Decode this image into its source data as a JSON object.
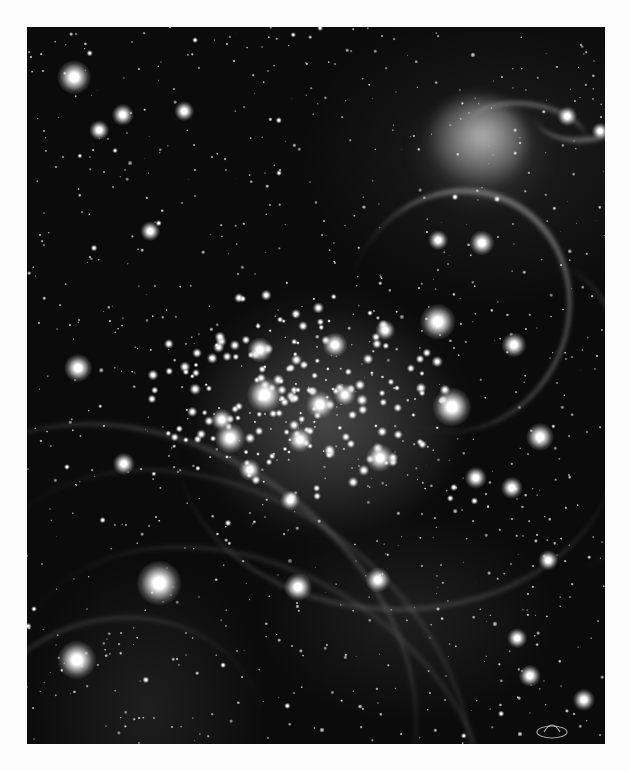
{
  "page": {
    "background": "#fcfcfc",
    "caption_top": "",
    "caption_bottom": ""
  },
  "image": {
    "description": "Grayscale astronomical photograph of a dense young star cluster with surrounding nebula filaments",
    "colors": {
      "sky": "#0b0b0b",
      "star_core": "#ffffff",
      "nebula": "#9a9a9a"
    },
    "bounds": {
      "left": 27,
      "top": 27,
      "width": 578,
      "height": 717
    },
    "cluster_center": {
      "x": 300,
      "y": 390
    },
    "nebula_features": [
      {
        "name": "swirl-nebula-top-right",
        "x": 445,
        "y": 120,
        "w": 90,
        "h": 80
      },
      {
        "name": "arc-filament-center-right",
        "from": [
          360,
          200
        ],
        "to": [
          470,
          300
        ]
      },
      {
        "name": "arc-filament-top-right",
        "from": [
          530,
          70
        ],
        "to": [
          600,
          110
        ]
      },
      {
        "name": "vertical-filament-right",
        "from": [
          560,
          260
        ],
        "to": [
          590,
          480
        ]
      },
      {
        "name": "diagonal-filaments-bottom-left",
        "from": [
          30,
          460
        ],
        "to": [
          320,
          740
        ]
      }
    ],
    "bright_stars": [
      {
        "x": 74,
        "y": 77,
        "r": 12
      },
      {
        "x": 123,
        "y": 115,
        "r": 8
      },
      {
        "x": 99,
        "y": 130,
        "r": 7
      },
      {
        "x": 184,
        "y": 111,
        "r": 7
      },
      {
        "x": 438,
        "y": 322,
        "r": 13
      },
      {
        "x": 452,
        "y": 407,
        "r": 14
      },
      {
        "x": 514,
        "y": 345,
        "r": 9
      },
      {
        "x": 540,
        "y": 437,
        "r": 10
      },
      {
        "x": 78,
        "y": 368,
        "r": 10
      },
      {
        "x": 124,
        "y": 464,
        "r": 8
      },
      {
        "x": 150,
        "y": 231,
        "r": 7
      },
      {
        "x": 159,
        "y": 583,
        "r": 16
      },
      {
        "x": 77,
        "y": 660,
        "r": 14
      },
      {
        "x": 298,
        "y": 587,
        "r": 10
      },
      {
        "x": 378,
        "y": 580,
        "r": 9
      },
      {
        "x": 476,
        "y": 478,
        "r": 8
      },
      {
        "x": 512,
        "y": 488,
        "r": 8
      },
      {
        "x": 548,
        "y": 560,
        "r": 7
      },
      {
        "x": 517,
        "y": 638,
        "r": 7
      },
      {
        "x": 530,
        "y": 676,
        "r": 8
      },
      {
        "x": 584,
        "y": 700,
        "r": 8
      },
      {
        "x": 438,
        "y": 240,
        "r": 7
      },
      {
        "x": 482,
        "y": 243,
        "r": 9
      },
      {
        "x": 567,
        "y": 116,
        "r": 7
      },
      {
        "x": 600,
        "y": 131,
        "r": 6
      },
      {
        "x": 265,
        "y": 395,
        "r": 13
      },
      {
        "x": 230,
        "y": 438,
        "r": 11
      },
      {
        "x": 320,
        "y": 405,
        "r": 10
      },
      {
        "x": 260,
        "y": 350,
        "r": 9
      },
      {
        "x": 335,
        "y": 345,
        "r": 9
      },
      {
        "x": 380,
        "y": 458,
        "r": 10
      },
      {
        "x": 222,
        "y": 420,
        "r": 8
      },
      {
        "x": 300,
        "y": 440,
        "r": 9
      },
      {
        "x": 345,
        "y": 395,
        "r": 8
      },
      {
        "x": 385,
        "y": 330,
        "r": 7
      },
      {
        "x": 250,
        "y": 470,
        "r": 8
      },
      {
        "x": 290,
        "y": 500,
        "r": 7
      }
    ],
    "cluster_star_count": 180,
    "field_star_count": 900,
    "seed": 7
  },
  "logo": {
    "icon": "observatory-logo-icon"
  }
}
